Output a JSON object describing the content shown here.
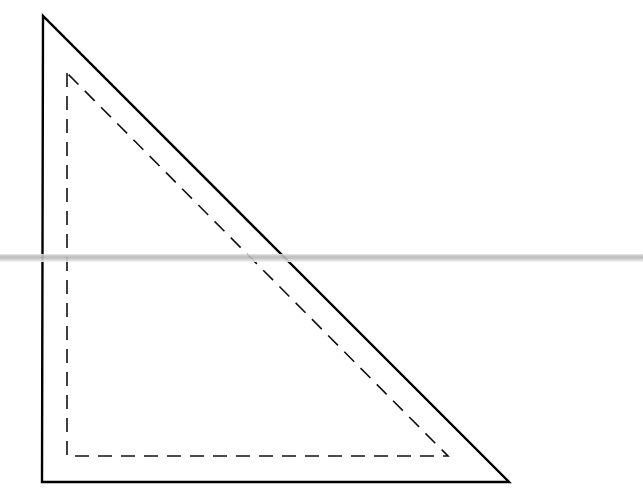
{
  "diagram": {
    "type": "right-triangle-with-inset-dashed-triangle",
    "outer_triangle": {
      "style": "solid",
      "stroke": "#000000",
      "points": [
        [
          43,
          16
        ],
        [
          42,
          482
        ],
        [
          509,
          482
        ]
      ]
    },
    "inner_triangle": {
      "style": "dashed",
      "stroke": "#000000",
      "points": [
        [
          67,
          73
        ],
        [
          67,
          456
        ],
        [
          448,
          456
        ]
      ]
    },
    "horizontal_rule": {
      "y": 258,
      "color": "#b8b8b8"
    }
  }
}
